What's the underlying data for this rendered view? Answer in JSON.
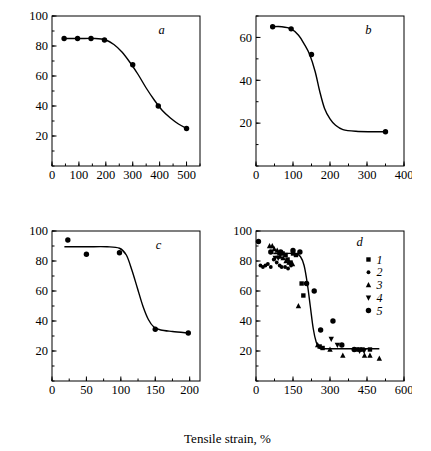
{
  "figure": {
    "xlabel": "Tensile strain, %",
    "ylabel": "Reversible strain (shrinkage), %",
    "marker_color": "#000000",
    "line_color": "#000000",
    "background": "#ffffff"
  },
  "chart_data": [
    {
      "id": "a",
      "type": "scatter",
      "title": "a",
      "xlabel": "Tensile strain, %",
      "ylabel": "Reversible strain (shrinkage), %",
      "xlim": [
        0,
        550
      ],
      "ylim": [
        0,
        100
      ],
      "xticks": [
        0,
        100,
        200,
        300,
        400,
        500
      ],
      "yticks": [
        20,
        40,
        60,
        80,
        100
      ],
      "xminor_step": 50,
      "yminor_step": 10,
      "grid": false,
      "legend": "none",
      "series": [
        {
          "name": "a-data",
          "marker": "circle",
          "points": [
            [
              45,
              85
            ],
            [
              95,
              85
            ],
            [
              145,
              85
            ],
            [
              195,
              84
            ],
            [
              300,
              67.5
            ],
            [
              395,
              40
            ],
            [
              500,
              25
            ]
          ]
        }
      ],
      "curve": [
        [
          40,
          85
        ],
        [
          100,
          85
        ],
        [
          160,
          85
        ],
        [
          200,
          84
        ],
        [
          230,
          81
        ],
        [
          260,
          76
        ],
        [
          290,
          69
        ],
        [
          320,
          61
        ],
        [
          350,
          52
        ],
        [
          380,
          44
        ],
        [
          410,
          37
        ],
        [
          440,
          32
        ],
        [
          470,
          28
        ],
        [
          500,
          25
        ]
      ]
    },
    {
      "id": "b",
      "type": "scatter",
      "title": "b",
      "xlabel": "Tensile strain, %",
      "ylabel": "Reversible strain (shrinkage), %",
      "xlim": [
        0,
        400
      ],
      "ylim": [
        0,
        70
      ],
      "xticks": [
        0,
        100,
        200,
        300,
        400
      ],
      "yticks": [
        20,
        40,
        60
      ],
      "xminor_step": 50,
      "yminor_step": 10,
      "grid": false,
      "legend": "none",
      "series": [
        {
          "name": "b-data",
          "marker": "circle",
          "points": [
            [
              45,
              65
            ],
            [
              95,
              64
            ],
            [
              150,
              52
            ],
            [
              350,
              16
            ]
          ]
        }
      ],
      "curve": [
        [
          42,
          65
        ],
        [
          70,
          65
        ],
        [
          95,
          64
        ],
        [
          115,
          61
        ],
        [
          130,
          57
        ],
        [
          145,
          52
        ],
        [
          160,
          44
        ],
        [
          172,
          35
        ],
        [
          185,
          27
        ],
        [
          200,
          22
        ],
        [
          215,
          19
        ],
        [
          235,
          17
        ],
        [
          270,
          16.2
        ],
        [
          310,
          16
        ],
        [
          350,
          16
        ]
      ]
    },
    {
      "id": "c",
      "type": "scatter",
      "title": "c",
      "xlabel": "Tensile strain, %",
      "ylabel": "Reversible strain (shrinkage), %",
      "xlim": [
        0,
        215
      ],
      "ylim": [
        0,
        100
      ],
      "xticks": [
        0,
        50,
        100,
        150,
        200
      ],
      "yticks": [
        20,
        40,
        60,
        80,
        100
      ],
      "xminor_step": 25,
      "yminor_step": 10,
      "grid": false,
      "legend": "none",
      "series": [
        {
          "name": "c-data",
          "marker": "circle",
          "points": [
            [
              23,
              94
            ],
            [
              50,
              84.5
            ],
            [
              98,
              85.5
            ],
            [
              150,
              34.5
            ],
            [
              198,
              32
            ]
          ]
        }
      ],
      "curve": [
        [
          18,
          89.5
        ],
        [
          50,
          89.5
        ],
        [
          80,
          89.5
        ],
        [
          98,
          88.5
        ],
        [
          108,
          84
        ],
        [
          116,
          74
        ],
        [
          124,
          62
        ],
        [
          132,
          50
        ],
        [
          140,
          41
        ],
        [
          148,
          36
        ],
        [
          158,
          34
        ],
        [
          175,
          33
        ],
        [
          198,
          32
        ]
      ]
    },
    {
      "id": "d",
      "type": "scatter",
      "title": "d",
      "xlabel": "Tensile strain, %",
      "ylabel": "Reversible strain (shrinkage), %",
      "xlim": [
        0,
        600
      ],
      "ylim": [
        0,
        100
      ],
      "xticks": [
        0,
        150,
        300,
        450,
        600
      ],
      "yticks": [
        20,
        40,
        60,
        80,
        100
      ],
      "xminor_step": 75,
      "yminor_step": 10,
      "grid": false,
      "legend": "inside-right",
      "legend_entries": [
        {
          "label": "1",
          "marker": "square"
        },
        {
          "label": "2",
          "marker": "dot"
        },
        {
          "label": "3",
          "marker": "triangle-up"
        },
        {
          "label": "4",
          "marker": "triangle-down"
        },
        {
          "label": "5",
          "marker": "circle"
        }
      ],
      "series": [
        {
          "name": "1",
          "marker": "square",
          "points": [
            [
              95,
              85
            ],
            [
              108,
              85
            ],
            [
              120,
              84
            ],
            [
              128,
              81
            ],
            [
              140,
              79
            ],
            [
              150,
              85
            ],
            [
              162,
              84
            ],
            [
              185,
              65
            ],
            [
              192,
              57
            ],
            [
              258,
              23
            ],
            [
              270,
              22
            ],
            [
              408,
              21
            ],
            [
              420,
              21
            ],
            [
              432,
              21
            ],
            [
              462,
              21
            ]
          ]
        },
        {
          "name": "2",
          "marker": "dot",
          "points": [
            [
              18,
              77
            ],
            [
              28,
              76
            ],
            [
              38,
              77
            ],
            [
              48,
              78
            ],
            [
              60,
              76
            ],
            [
              72,
              81
            ],
            [
              84,
              79
            ],
            [
              96,
              77
            ],
            [
              104,
              76
            ],
            [
              118,
              76
            ],
            [
              130,
              75
            ],
            [
              142,
              77
            ]
          ]
        },
        {
          "name": "3",
          "marker": "triangle-up",
          "points": [
            [
              55,
              90
            ],
            [
              66,
              90
            ],
            [
              74,
              88
            ],
            [
              86,
              87
            ],
            [
              98,
              83
            ],
            [
              110,
              82
            ],
            [
              122,
              80
            ],
            [
              134,
              79
            ],
            [
              148,
              78
            ],
            [
              172,
              50
            ],
            [
              250,
              24
            ],
            [
              300,
              21
            ],
            [
              352,
              17
            ],
            [
              440,
              17
            ],
            [
              462,
              17
            ],
            [
              500,
              15
            ]
          ]
        },
        {
          "name": "4",
          "marker": "triangle-down",
          "points": [
            [
              78,
              82
            ],
            [
              90,
              82
            ],
            [
              305,
              28
            ],
            [
              330,
              24
            ],
            [
              420,
              20
            ],
            [
              438,
              20
            ]
          ]
        },
        {
          "name": "5",
          "marker": "circle",
          "points": [
            [
              10,
              93
            ],
            [
              60,
              86
            ],
            [
              100,
              86
            ],
            [
              150,
              87
            ],
            [
              178,
              86
            ],
            [
              205,
              65
            ],
            [
              236,
              60
            ],
            [
              262,
              34
            ],
            [
              312,
              40
            ],
            [
              348,
              24
            ],
            [
              398,
              21
            ]
          ]
        }
      ],
      "curve": [
        [
          70,
          85
        ],
        [
          120,
          85
        ],
        [
          160,
          85
        ],
        [
          180,
          83
        ],
        [
          195,
          77
        ],
        [
          208,
          65
        ],
        [
          220,
          50
        ],
        [
          232,
          35
        ],
        [
          244,
          26
        ],
        [
          256,
          22
        ],
        [
          275,
          21.5
        ],
        [
          320,
          21.5
        ],
        [
          380,
          21.5
        ],
        [
          440,
          21.5
        ],
        [
          500,
          21.5
        ]
      ]
    }
  ]
}
